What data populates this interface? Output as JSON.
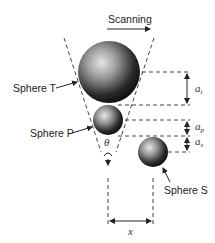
{
  "diagram": {
    "scan_label": "Scanning",
    "spheres": [
      {
        "name": "Sphere T",
        "label": "Sphere T"
      },
      {
        "name": "Sphere P",
        "label": "Sphere P"
      },
      {
        "name": "Sphere S",
        "label": "Sphere S"
      }
    ],
    "dimensions": {
      "a_t": {
        "base": "a",
        "sub": "t"
      },
      "a_p": {
        "base": "a",
        "sub": "p"
      },
      "a_s": {
        "base": "a",
        "sub": "s"
      },
      "x": "x",
      "theta": "θ"
    }
  }
}
